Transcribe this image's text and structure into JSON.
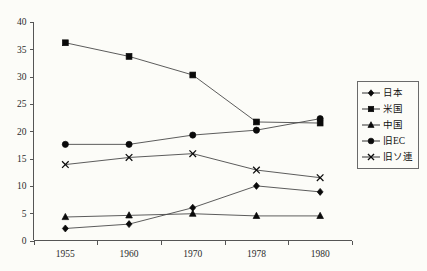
{
  "chart_data": {
    "type": "line",
    "title": "",
    "subtitle": "",
    "xlabel": "",
    "ylabel": "",
    "grid": false,
    "legend_position": "right",
    "categories": [
      "1955",
      "1960",
      "1970",
      "1978",
      "1980"
    ],
    "x": [
      1955,
      1960,
      1970,
      1978,
      1980
    ],
    "xlim": [
      0,
      4
    ],
    "ylim": [
      0,
      40
    ],
    "yticks": [
      0,
      5,
      10,
      15,
      20,
      25,
      30,
      35,
      40
    ],
    "ytick_labels": [
      "0",
      "5",
      "10",
      "15",
      "20",
      "25",
      "30",
      "35",
      "40"
    ],
    "xtick_labels": [
      "1955",
      "1960",
      "1970",
      "1978",
      "1980"
    ],
    "series": [
      {
        "name": "日本",
        "marker": "diamond",
        "color": "#0a0a0a",
        "values": [
          2.2,
          3.0,
          6.0,
          10.0,
          8.9
        ]
      },
      {
        "name": "米国",
        "marker": "square",
        "color": "#0a0a0a",
        "values": [
          36.2,
          33.7,
          30.3,
          21.7,
          21.5
        ]
      },
      {
        "name": "中国",
        "marker": "triangle",
        "color": "#0a0a0a",
        "values": [
          4.3,
          4.6,
          4.9,
          4.5,
          4.5
        ]
      },
      {
        "name": "旧EC",
        "marker": "circle",
        "color": "#0a0a0a",
        "values": [
          17.6,
          17.6,
          19.3,
          20.2,
          22.3
        ]
      },
      {
        "name": "旧ソ連",
        "marker": "cross",
        "color": "#0a0a0a",
        "values": [
          13.9,
          15.2,
          15.9,
          12.9,
          11.5
        ]
      }
    ]
  },
  "legend": {
    "items": [
      {
        "label": "日本",
        "marker": "diamond"
      },
      {
        "label": "米国",
        "marker": "square"
      },
      {
        "label": "中国",
        "marker": "triangle"
      },
      {
        "label": "旧EC",
        "marker": "circle"
      },
      {
        "label": "旧ソ連",
        "marker": "cross"
      }
    ]
  },
  "colors": {
    "line": "#4a4a4a",
    "marker": "#0a0a0a",
    "axis": "#555555",
    "background": "#fcfcf8",
    "text": "#1a1a1a"
  }
}
